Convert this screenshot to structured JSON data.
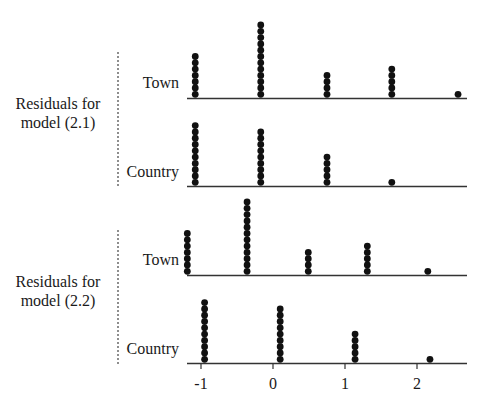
{
  "chart_data": {
    "type": "scatter",
    "subtype": "stacked-dot-plot",
    "title": "",
    "xlabel": "",
    "ylabel": "",
    "xlim": [
      -1.2,
      2.65
    ],
    "x_ticks": [
      -1,
      0,
      1,
      2
    ],
    "x_tick_labels": [
      "-1",
      "0",
      "1",
      "2"
    ],
    "grid": false,
    "legend": null,
    "groups": [
      {
        "label_line1": "Residuals for",
        "label_line2": "model (2.1)",
        "series": [
          {
            "name": "Town",
            "x": [
              -1.08,
              -0.17,
              0.75,
              1.65,
              2.57
            ],
            "counts": [
              7,
              12,
              4,
              5,
              1
            ]
          },
          {
            "name": "Country",
            "x": [
              -1.08,
              -0.17,
              0.75,
              1.65
            ],
            "counts": [
              10,
              9,
              5,
              1
            ]
          }
        ]
      },
      {
        "label_line1": "Residuals for",
        "label_line2": "model (2.2)",
        "series": [
          {
            "name": "Town",
            "x": [
              -1.19,
              -0.36,
              0.49,
              1.31,
              2.15
            ],
            "counts": [
              7,
              12,
              4,
              5,
              1
            ]
          },
          {
            "name": "Country",
            "x": [
              -0.95,
              0.1,
              1.14,
              2.18
            ],
            "counts": [
              10,
              9,
              5,
              1
            ]
          }
        ]
      }
    ]
  },
  "style": {
    "dot_color": "#111111",
    "line_color": "#333333",
    "text_color": "#1a1a1a"
  }
}
